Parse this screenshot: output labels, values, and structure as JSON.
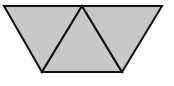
{
  "diagram": {
    "colors": {
      "fill": "#c8c8c8",
      "stroke": "#111111",
      "background": "#ffffff"
    },
    "vertices": {
      "top_left": [
        4,
        6
      ],
      "top_middle": [
        82,
        6
      ],
      "top_right": [
        162,
        6
      ],
      "bottom_left": [
        42,
        72
      ],
      "bottom_right": [
        122,
        72
      ]
    },
    "triangles": [
      {
        "name": "left-triangle",
        "points": "4,6 82,6 42,72"
      },
      {
        "name": "middle-triangle",
        "points": "82,6 42,72 122,72"
      },
      {
        "name": "right-triangle",
        "points": "82,6 162,6 122,72"
      }
    ]
  }
}
